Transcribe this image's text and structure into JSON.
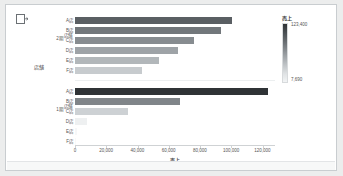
{
  "toolbar": {
    "icons": [
      {
        "name": "duplicate-icon",
        "label": "複製"
      }
    ]
  },
  "legend": {
    "title": "売上",
    "max_label": "123,400",
    "min_label": "7,690",
    "color_high": "#2f3336",
    "color_low": "#f2f4f5"
  },
  "axes": {
    "y_field_title": "店舗",
    "y_pane_field": "期",
    "x_title": "売上",
    "x_ticks": [
      "0",
      "20,000",
      "40,000",
      "60,000",
      "80,000",
      "100,000",
      "120,000"
    ]
  },
  "panes": [
    {
      "group_label": "2期",
      "pane_field": "店舗"
    },
    {
      "group_label": "1期",
      "pane_field": "店舗"
    }
  ],
  "chart_data": {
    "type": "bar",
    "orientation": "horizontal",
    "title": "",
    "xlabel": "売上",
    "ylabel": "店舗",
    "xlim": [
      0,
      128000
    ],
    "xticks": [
      0,
      20000,
      40000,
      60000,
      80000,
      100000,
      120000
    ],
    "xtick_labels": [
      "0",
      "20,000",
      "40,000",
      "60,000",
      "80,000",
      "100,000",
      "120,000"
    ],
    "grid": false,
    "legend": {
      "position": "right",
      "title": "売上",
      "type": "continuous-color",
      "domain": [
        7690,
        123400
      ],
      "labels": [
        "123,400",
        "7,690"
      ]
    },
    "categories": [
      "A店",
      "B店",
      "C店",
      "D店",
      "E店",
      "F店"
    ],
    "panes": [
      {
        "name": "2期",
        "values": [
          100200,
          93500,
          76100,
          66200,
          53800,
          43100
        ],
        "colors": [
          "#5a5f63",
          "#72777b",
          "#878c90",
          "#9ea3a7",
          "#b2b7ba",
          "#c7cbce"
        ]
      },
      {
        "name": "1期",
        "values": [
          123400,
          67300,
          34200,
          7690,
          1200,
          900
        ],
        "colors": [
          "#2f3336",
          "#808589",
          "#cdd1d4",
          "#eef0f1",
          "#f6f7f8",
          "#f8f9f9"
        ]
      }
    ]
  }
}
